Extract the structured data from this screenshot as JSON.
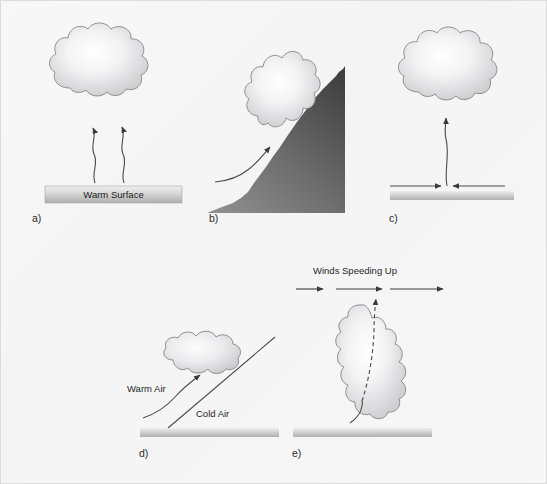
{
  "figure": {
    "background_color": "#f7f7f7",
    "width": 547,
    "height": 484,
    "border_color": "#d8d8d8"
  },
  "colors": {
    "cloud_outline": "#8a8a8a",
    "cloud_center": "#ffffff",
    "cloud_edge": "#d5d5d7",
    "ground_light": "#f2f2f2",
    "ground_dark": "#b6b6b6",
    "mountain_light": "#9a9a9a",
    "mountain_dark": "#4a4a4a",
    "arrow_color": "#3a3a3a",
    "text_color": "#1f1f1f"
  },
  "panels": [
    {
      "id": "a",
      "label": "a)",
      "mechanism": "surface-heating-convection",
      "surface_label": "Warm Surface",
      "cloud_shape": "cumulus-round",
      "arrows": "two-wavy-rising-thermals"
    },
    {
      "id": "b",
      "label": "b)",
      "mechanism": "orographic-lifting",
      "surface_label": "",
      "cloud_shape": "cumulus-tall",
      "arrows": "one-curved-upslope"
    },
    {
      "id": "c",
      "label": "c)",
      "mechanism": "surface-convergence",
      "surface_label": "",
      "cloud_shape": "cumulus-round",
      "arrows": "two-converging-horizontal-plus-one-rising"
    },
    {
      "id": "d",
      "label": "d)",
      "mechanism": "frontal-lifting",
      "warm_air_label": "Warm Air",
      "cold_air_label": "Cold Air",
      "cloud_shape": "stratiform-flat",
      "arrows": "one-curved-rising-along-front"
    },
    {
      "id": "e",
      "label": "e)",
      "mechanism": "upper-level-divergence",
      "winds_label": "Winds Speeding Up",
      "cloud_shape": "cumulus-vertical-tall",
      "arrows": "three-horizontal-increasing-length-plus-dashed-updraft"
    }
  ]
}
